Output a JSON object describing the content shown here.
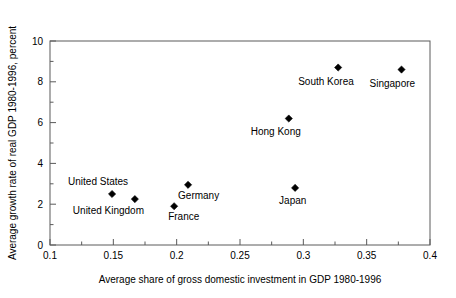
{
  "chart_data": {
    "type": "scatter",
    "title": "",
    "xlabel": "Average share of gross domestic investment in GDP 1980-1996",
    "ylabel": "Average growth rate of real GDP 1980-1996, percent",
    "xlim": [
      0.1,
      0.4
    ],
    "ylim": [
      0,
      10
    ],
    "grid": false,
    "legend": "none",
    "xticks": [
      "0.1",
      "0.15",
      "0.2",
      "0.25",
      "0.3",
      "0.35",
      "0.4"
    ],
    "xtick_values": [
      0.1,
      0.15,
      0.2,
      0.25,
      0.3,
      0.35,
      0.4
    ],
    "x_minor_values": [
      0.125,
      0.175,
      0.225,
      0.275,
      0.325,
      0.375
    ],
    "yticks": [
      "0",
      "2",
      "4",
      "6",
      "8",
      "10"
    ],
    "ytick_values": [
      0,
      2,
      4,
      6,
      8,
      10
    ],
    "y_minor_values": [
      1,
      3,
      5,
      7,
      9
    ],
    "marker": "diamond",
    "marker_color": "#000000",
    "points": [
      {
        "label": "United  States",
        "x": 0.149,
        "y": 2.5,
        "label_dx": -44,
        "label_dy": -9,
        "anchor": "start"
      },
      {
        "label": "United  Kingdom",
        "x": 0.167,
        "y": 2.25,
        "label_dx": -62,
        "label_dy": 15,
        "anchor": "start"
      },
      {
        "label": "France",
        "x": 0.198,
        "y": 1.9,
        "label_dx": -6,
        "label_dy": 14,
        "anchor": "start"
      },
      {
        "label": "Germany",
        "x": 0.209,
        "y": 2.95,
        "label_dx": -10,
        "label_dy": 14,
        "anchor": "start"
      },
      {
        "label": "Japan",
        "x": 0.2935,
        "y": 2.8,
        "label_dx": -16,
        "label_dy": 16,
        "anchor": "start"
      },
      {
        "label": "Hong Kong",
        "x": 0.2885,
        "y": 6.2,
        "label_dx": -38,
        "label_dy": 16,
        "anchor": "start"
      },
      {
        "label": "South Korea",
        "x": 0.3275,
        "y": 8.7,
        "label_dx": -40,
        "label_dy": 17,
        "anchor": "start"
      },
      {
        "label": "Singapore",
        "x": 0.3775,
        "y": 8.6,
        "label_dx": -32,
        "label_dy": 17,
        "anchor": "start"
      }
    ]
  }
}
